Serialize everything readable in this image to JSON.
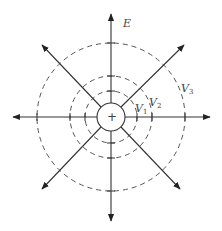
{
  "diagram": {
    "charge_symbol": "+",
    "field_label": "E",
    "equipotentials": [
      {
        "label": "V",
        "subscript": "1"
      },
      {
        "label": "V",
        "subscript": "2"
      },
      {
        "label": "V",
        "subscript": "3"
      }
    ],
    "field_line_count": 8,
    "colors": {
      "line": "#333333",
      "dash": "#555555",
      "background": "#ffffff"
    }
  }
}
